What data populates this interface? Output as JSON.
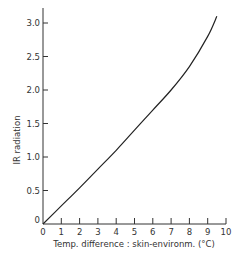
{
  "chart_data": {
    "type": "line",
    "title": "",
    "xlabel": "Temp. difference : skin-environm. (°C)",
    "ylabel": "IR radiation",
    "xlim": [
      0,
      10
    ],
    "ylim": [
      0,
      3.0
    ],
    "x_ticks": [
      "0",
      "1",
      "2",
      "3",
      "4",
      "5",
      "6",
      "7",
      "8",
      "9",
      "10"
    ],
    "y_ticks": [
      "0",
      "0.5",
      "1.0",
      "1.5",
      "2.0",
      "2.5",
      "3.0"
    ],
    "grid": false,
    "legend": null,
    "series": [
      {
        "name": "IR radiation",
        "x": [
          0,
          1,
          2,
          3,
          4,
          5,
          6,
          7,
          8,
          9,
          9.5
        ],
        "values": [
          0,
          0.27,
          0.54,
          0.82,
          1.1,
          1.4,
          1.7,
          2.0,
          2.35,
          2.8,
          3.1
        ]
      }
    ]
  },
  "colors": {
    "axis": "#333333",
    "line": "#222222"
  }
}
